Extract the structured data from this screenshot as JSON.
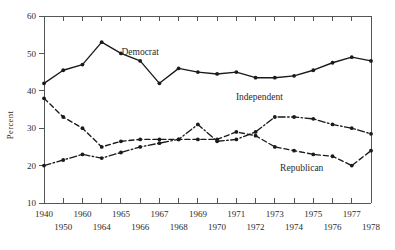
{
  "chart_data": {
    "type": "line",
    "title": "",
    "xlabel": "",
    "ylabel": "Percent",
    "ylim": [
      10,
      60
    ],
    "yticks": [
      10,
      20,
      30,
      40,
      50,
      60
    ],
    "ytick_labels": [
      "10",
      "20",
      "30",
      "40",
      "50",
      "60"
    ],
    "grid": false,
    "legend": "inline-annotations",
    "x": [
      1940,
      1950,
      1960,
      1964,
      1965,
      1966,
      1967,
      1968,
      1969,
      1970,
      1971,
      1972,
      1973,
      1974,
      1975,
      1976,
      1977,
      1978
    ],
    "xtick_labels": [
      "1940",
      "1950",
      "1960",
      "1964",
      "1965",
      "1966",
      "1967",
      "1968",
      "1969",
      "1970",
      "1971",
      "1972",
      "1973",
      "1974",
      "1975",
      "1976",
      "1977",
      "1978"
    ],
    "xtick_rows": [
      [
        "1940",
        "1960",
        "1965",
        "1967",
        "1969",
        "1971",
        "1973",
        "1975",
        "1977"
      ],
      [
        "1950",
        "1964",
        "1966",
        "1968",
        "1970",
        "1972",
        "1974",
        "1976",
        "1978"
      ]
    ],
    "series": [
      {
        "name": "Democrat",
        "style": "solid",
        "values": [
          42,
          45.5,
          47,
          53,
          50,
          48,
          42,
          46,
          45,
          44.5,
          45,
          43.5,
          43.5,
          44,
          45.5,
          47.5,
          49,
          48
        ]
      },
      {
        "name": "Independent",
        "style": "dash-dot",
        "values": [
          20,
          21.5,
          23,
          22,
          23.5,
          25,
          26,
          27,
          31,
          26.5,
          27,
          29,
          33,
          33,
          32.5,
          31,
          30,
          28.5
        ]
      },
      {
        "name": "Republican",
        "style": "dashed",
        "values": [
          38,
          33,
          30,
          25,
          26.5,
          27,
          27,
          27,
          27,
          27,
          29,
          28,
          25,
          24,
          23,
          22.5,
          20,
          24
        ]
      }
    ],
    "annotations": [
      {
        "text": "Democrat",
        "x": 1966,
        "y": 49.5
      },
      {
        "text": "Independent",
        "x": 1972.2,
        "y": 37.5
      },
      {
        "text": "Republican",
        "x": 1974.4,
        "y": 18.5
      }
    ],
    "colors": {
      "line": "#1a1a1a",
      "axis": "#555555",
      "text": "#2b2b2b",
      "background": "#ffffff"
    }
  },
  "caption": {
    "ghost_text": ""
  }
}
